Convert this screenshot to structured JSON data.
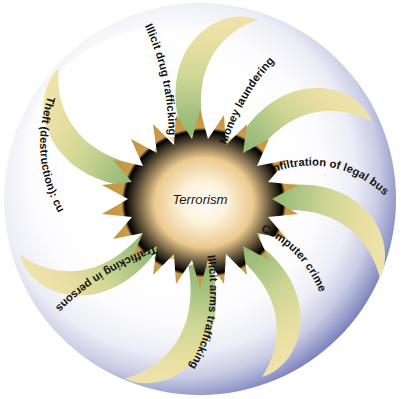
{
  "figure": {
    "type": "radial-convergence-diagram",
    "center": {
      "label": "Terrorism",
      "shape": "starburst",
      "fill_outer": "#c8973f",
      "fill_inner": "#fdf6ea"
    },
    "sphere": {
      "rim_color": "#7b84bd",
      "rim_color_deep": "#5c64a8",
      "fill_color": "#ffffff",
      "highlight_color": "#ffffff"
    },
    "arrow_style": {
      "tail_outer_color": "#9cbd79",
      "tail_mid_color": "#cdd793",
      "tail_inner_color": "#efe1a2",
      "head_color": "#ecd58a",
      "head_edge_color": "#e3c673"
    },
    "arrows": [
      {
        "id": "illicit-drug-trafficking",
        "label": "Illicit drug trafficking",
        "angle_deg": 270,
        "text_side": "inner"
      },
      {
        "id": "money-laundering",
        "label": "Money laundering",
        "angle_deg": 318,
        "text_side": "inner"
      },
      {
        "id": "infiltration-of-legal-business",
        "label": "Infiltration of legal business",
        "angle_deg": 6,
        "text_side": "inner"
      },
      {
        "id": "computer-crime",
        "label": "Computer crime",
        "angle_deg": 53,
        "text_side": "inner"
      },
      {
        "id": "illicit-arms-trafficking",
        "label": "Illicit arms trafficking",
        "angle_deg": 95,
        "text_side": "inner"
      },
      {
        "id": "trafficking-in-persons",
        "label": "Trafficking in persons",
        "angle_deg": 145,
        "text_side": "inner"
      },
      {
        "id": "theft-destruction-cultural",
        "label": "Theft (destruction): cultural",
        "angle_deg": 205,
        "text_side": "inner"
      }
    ]
  }
}
